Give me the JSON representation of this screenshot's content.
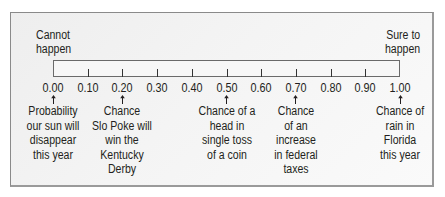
{
  "diagram": {
    "left_end_label": [
      "Cannot",
      "happen"
    ],
    "right_end_label": [
      "Sure to",
      "happen"
    ],
    "scale": {
      "min": 0.0,
      "max": 1.0,
      "step": 0.1,
      "tick_labels": [
        "0.00",
        "0.10",
        "0.20",
        "0.30",
        "0.40",
        "0.50",
        "0.60",
        "0.70",
        "0.80",
        "0.90",
        "1.00"
      ]
    },
    "annotations": [
      {
        "value": 0.0,
        "lines": [
          "Probability",
          "our sun will",
          "disappear",
          "this year"
        ]
      },
      {
        "value": 0.2,
        "lines": [
          "Chance",
          "Slo Poke will",
          "win the",
          "Kentucky",
          "Derby"
        ]
      },
      {
        "value": 0.5,
        "lines": [
          "Chance of a",
          "head in",
          "single toss",
          "of a coin"
        ]
      },
      {
        "value": 0.7,
        "lines": [
          "Chance",
          "of an",
          "increase",
          "in federal",
          "taxes"
        ]
      },
      {
        "value": 1.0,
        "lines": [
          "Chance of",
          "rain in",
          "Florida",
          "this year"
        ]
      }
    ],
    "colors": {
      "text": "#231f20",
      "frame_border": "#8a8a8a",
      "frame_bg": "#f2f2f2",
      "bar_border": "#6a6a6a"
    }
  }
}
